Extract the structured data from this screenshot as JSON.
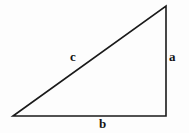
{
  "figure": {
    "kind": "right-triangle-diagram",
    "background_color": "#fdfdfd",
    "stroke_color": "#1a1a1a",
    "stroke_width": 1.6,
    "labels": {
      "hypotenuse": "c",
      "vertical_leg": "a",
      "horizontal_leg": "b"
    },
    "label_color": "#141414",
    "vertices": {
      "left": {
        "x": 13,
        "y": 116
      },
      "apex": {
        "x": 166,
        "y": 6
      },
      "right_angle": {
        "x": 166,
        "y": 116
      }
    },
    "label_positions": {
      "c": {
        "x": 75,
        "y": 57
      },
      "a": {
        "x": 174,
        "y": 57
      },
      "b": {
        "x": 104,
        "y": 124
      }
    }
  }
}
